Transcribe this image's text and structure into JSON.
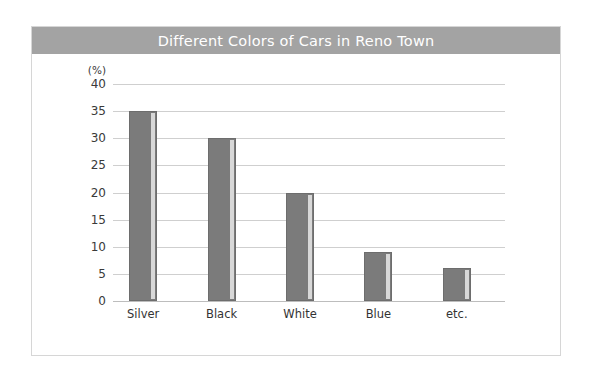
{
  "chart_data": {
    "type": "bar",
    "title": "Different Colors of Cars in Reno Town",
    "categories": [
      "Silver",
      "Black",
      "White",
      "Blue",
      "etc."
    ],
    "values": [
      35,
      30,
      20,
      9,
      6
    ],
    "xlabel": "",
    "ylabel": "(%)",
    "ylim": [
      0,
      40
    ],
    "yticks": [
      0,
      5,
      10,
      15,
      20,
      25,
      30,
      35,
      40
    ],
    "ytick_labels": [
      "0",
      "5",
      "10",
      "15",
      "20",
      "25",
      "30",
      "35",
      "40"
    ],
    "grid": true,
    "legend": false,
    "series": [
      {
        "name": "Share of cars",
        "values": [
          35,
          30,
          20,
          9,
          6
        ]
      }
    ],
    "colors": {
      "bar_fill": "#7b7b7b",
      "bar_highlight": "#d8d8d8",
      "title_bar": "#a3a3a3",
      "title_text": "#ffffff",
      "gridline": "#cfcfcf",
      "frame": "#d6d6d6",
      "background": "#ffffff"
    }
  }
}
